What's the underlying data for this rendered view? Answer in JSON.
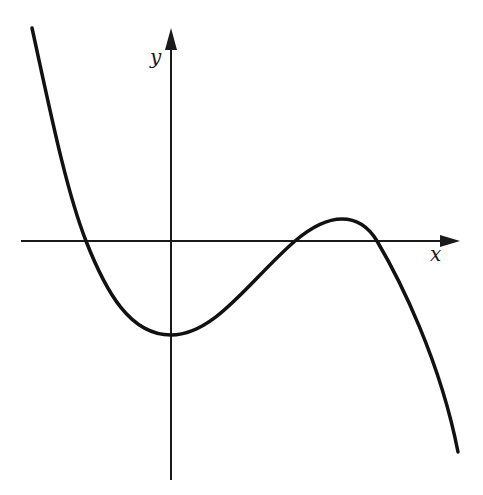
{
  "figure": {
    "colors": {
      "background": "#ffffff",
      "axis": "#1a1a1a",
      "curve": "#111111"
    },
    "axes": {
      "x_label": "x",
      "y_label": "y",
      "origin_px": [
        171,
        241
      ],
      "x_axis_px": {
        "start": 21,
        "end": 460
      },
      "y_axis_px": {
        "top": 28,
        "bottom": 480
      }
    },
    "curve": {
      "type": "cubic",
      "points_px": [
        [
          32,
          28
        ],
        [
          86,
          241
        ],
        [
          171,
          335
        ],
        [
          295,
          241
        ],
        [
          342,
          219
        ],
        [
          377,
          241
        ],
        [
          458,
          452
        ]
      ],
      "features": {
        "x_intercepts": 3,
        "local_min": "near x = 0, below x-axis",
        "local_max": "positive x, slightly above x-axis"
      }
    }
  }
}
